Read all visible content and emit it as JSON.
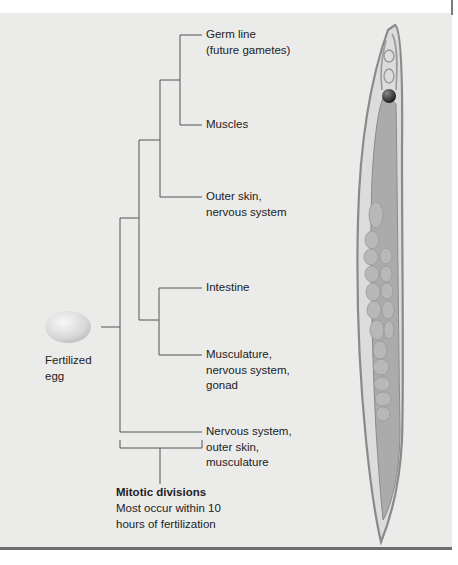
{
  "figure": {
    "type": "cell-lineage-diagram",
    "root": {
      "label": "Fertilized\negg"
    },
    "leaves": [
      {
        "id": "germ",
        "label": "Germ line\n(future gametes)"
      },
      {
        "id": "muscles",
        "label": "Muscles"
      },
      {
        "id": "outer-skin",
        "label": "Outer skin,\nnervous system"
      },
      {
        "id": "intestine",
        "label": "Intestine"
      },
      {
        "id": "musculature",
        "label": "Musculature,\nnervous system,\ngonad"
      },
      {
        "id": "nervous",
        "label": "Nervous system,\nouter skin,\nmusculature"
      }
    ],
    "annotation": {
      "title": "Mitotic divisions",
      "body": "Most occur within 10\nhours of fertilization"
    },
    "colors": {
      "background": "#ebebea",
      "line": "#555555",
      "worm_outline": "#8a8a8a",
      "worm_body": "#d6d6d6",
      "worm_organs": "#a9a9a9",
      "egg": "#d9d9d9",
      "pharynx_bulb": "#3a3a3a"
    }
  }
}
